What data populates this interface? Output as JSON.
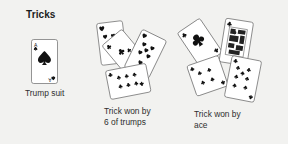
{
  "figure": {
    "title": "Tricks",
    "background_color": "#f2f2f0",
    "ink_color": "#111111",
    "card_face_color": "#ffffff",
    "card_border_color": "#7a7a7a"
  },
  "trump": {
    "caption": "Trump suit",
    "card": {
      "rank": "A",
      "suit": "spade",
      "suit_symbol": "♠",
      "name": "ace-of-spades"
    }
  },
  "groups": [
    {
      "id": "trick-six-of-trumps",
      "caption": "Trick won by\n6 of trumps",
      "caption_line_1": "Trick won by",
      "caption_line_2": "6 of trumps",
      "card_count": 4,
      "cards": [
        {
          "name": "heart-card-top-left",
          "suit": "heart",
          "suit_symbol": "♥"
        },
        {
          "name": "club-card-middle",
          "suit": "club",
          "suit_symbol": "♣"
        },
        {
          "name": "heart-card-right",
          "suit": "heart",
          "suit_symbol": "♥"
        },
        {
          "name": "club-card-bottom",
          "suit": "club",
          "suit_symbol": "♣"
        }
      ]
    },
    {
      "id": "trick-ace",
      "caption": "Trick won by\nace",
      "caption_line_1": "Trick won by",
      "caption_line_2": "ace",
      "card_count": 4,
      "cards": [
        {
          "name": "club-ace-card",
          "suit": "club",
          "suit_symbol": "♣"
        },
        {
          "name": "club-face-card",
          "suit": "club",
          "suit_symbol": "♣"
        },
        {
          "name": "club-card-lower-left",
          "suit": "club",
          "suit_symbol": "♣"
        },
        {
          "name": "club-card-lower-right",
          "suit": "club",
          "suit_symbol": "♣"
        }
      ]
    }
  ]
}
